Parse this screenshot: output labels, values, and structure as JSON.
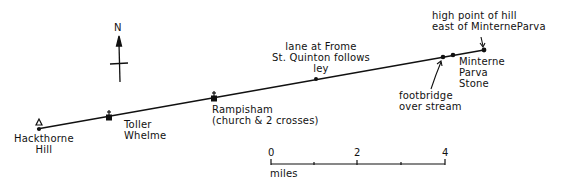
{
  "compass": {
    "label": "N"
  },
  "ley_line": {
    "color": "#111111",
    "points": [
      {
        "id": "hackthorne-hill",
        "label": "Hackthorne\nHill",
        "symbol": "triangle-hilltop"
      },
      {
        "id": "toller-whelme",
        "label": "Toller\nWhelme",
        "symbol": "church"
      },
      {
        "id": "rampisham",
        "label": "Rampisham\n(church & 2 crosses)",
        "symbol": "church"
      },
      {
        "id": "frome-st-quintin-lane",
        "label": "lane at Frome\nSt. Quinton follows\nley",
        "symbol": "dot"
      },
      {
        "id": "footbridge",
        "label": "footbridge\nover stream",
        "symbol": "dot"
      },
      {
        "id": "minterne-parva-stone",
        "label": "Minterne\nParva\nStone",
        "symbol": "dot"
      },
      {
        "id": "hill-east-of-minterne-parva",
        "label": "high point of hill\neast of MinterneParva",
        "symbol": "dot"
      }
    ]
  },
  "scale_bar": {
    "ticks": [
      "0",
      "2",
      "4"
    ],
    "unit": "miles"
  }
}
